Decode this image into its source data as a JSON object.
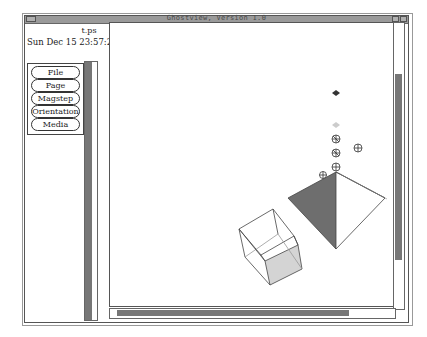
{
  "window": {
    "title": "Ghostview, Version 1.0",
    "menu_corner_label": "",
    "titlebar_buttons": [
      "iconify",
      "maximize"
    ]
  },
  "document": {
    "filename": "t.ps",
    "date": "Sun Dec 15 23:57:24 1"
  },
  "menu_buttons": [
    {
      "label": "File"
    },
    {
      "label": "Page"
    },
    {
      "label": "Magstep"
    },
    {
      "label": "Orientation"
    },
    {
      "label": "Media"
    }
  ],
  "scrollbars": {
    "page_list": {
      "orientation": "vertical"
    },
    "view_vertical": {
      "orientation": "vertical"
    },
    "view_horizontal": {
      "orientation": "horizontal"
    }
  },
  "colors": {
    "titlebar": "#9a9a9a",
    "thumb": "#777777",
    "pyramid_dark": "#6e6e6e",
    "cube_face": "#d4d4d4"
  },
  "drawing": {
    "objects": [
      "dark-diamond",
      "light-diamond",
      "small-polyhedron",
      "small-polyhedron",
      "small-polyhedron",
      "small-polyhedron",
      "pyramid",
      "wireframe-cube"
    ]
  }
}
